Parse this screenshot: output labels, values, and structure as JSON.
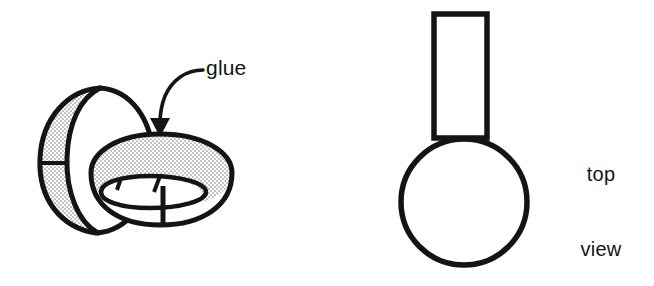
{
  "figure": {
    "background_color": "#ffffff",
    "ink_color": "#141414",
    "stipple_color": "#8c8c8c",
    "annotations": {
      "glue": "glue",
      "top_view_line_1": "top",
      "top_view_line_2": "view"
    },
    "left_illustration": {
      "name": "two-interlocking-paper-rings",
      "description": "Perspective drawing of two interlocking bands: one vertical ring seen nearly edge-on and one horizontal ring seen from above at an angle. Inner wall surfaces are shown with stipple shading.",
      "vertical_ring": {
        "outer_band_fill": "stipple",
        "inner_face_fill": "white",
        "seam_marks": 1
      },
      "horizontal_ring": {
        "far_inner_wall_fill": "stipple",
        "near_inner_wall_fill": "white",
        "seam_marks": 3
      },
      "arrow": {
        "name": "glue-arrow",
        "style": "curved leader with solid triangular head",
        "points_to": "top of horizontal ring where the two bands are joined"
      }
    },
    "right_illustration": {
      "name": "top-view-schematic",
      "description": "Schematic top view: an open rectangle standing vertically whose lower end meets a circle.",
      "shapes": [
        {
          "name": "rectangle",
          "x": 434,
          "y": 14,
          "width": 53,
          "height": 124
        },
        {
          "name": "circle",
          "cx": 464,
          "cy": 202,
          "r": 63
        }
      ]
    }
  }
}
